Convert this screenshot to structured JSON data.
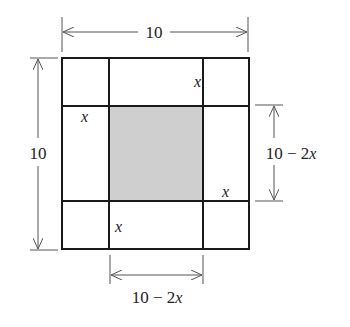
{
  "diagram": {
    "colors": {
      "line": "#1a1a1a",
      "dim_line": "#555555",
      "shade": "#cfcfcf",
      "background": "#ffffff"
    },
    "labels": {
      "top_width": "10",
      "left_height": "10",
      "right_dim": "10 − 2",
      "right_dim_var": "x",
      "bottom_dim": "10 − 2",
      "bottom_dim_var": "x",
      "x_top_middle": "x",
      "x_left_middle": "x",
      "x_right_middle": "x",
      "x_bottom_middle": "x"
    }
  }
}
